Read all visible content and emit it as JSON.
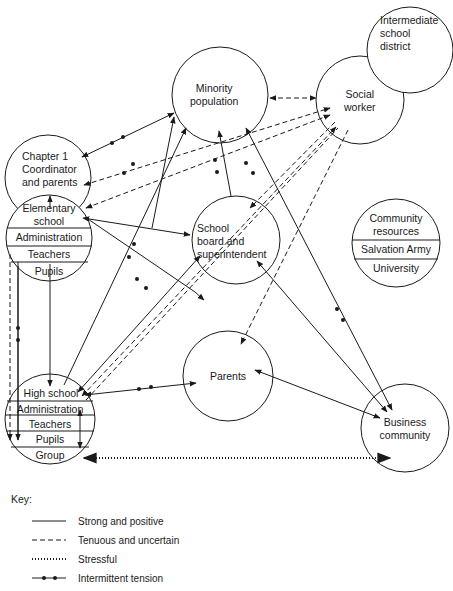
{
  "nodes": {
    "minority_population": [
      "Minority",
      "population"
    ],
    "intermediate_school_district": [
      "Intermediate",
      "school",
      "district"
    ],
    "social_worker": [
      "Social",
      "worker"
    ],
    "chapter1": [
      "Chapter 1",
      "Coordinator",
      "and parents"
    ],
    "elementary_school": {
      "title": [
        "Elementary",
        "school"
      ],
      "sections": [
        "Administration",
        "Teachers",
        "Pupils"
      ]
    },
    "school_board": [
      "School",
      "board and",
      "superintendent"
    ],
    "community_resources": {
      "title": [
        "Community",
        "resources"
      ],
      "sections": [
        "Salvation Army",
        "University"
      ]
    },
    "parents": [
      "Parents"
    ],
    "high_school": {
      "title": "High school",
      "sections": [
        "Administration",
        "Teachers",
        "Pupils",
        "Group"
      ]
    },
    "business_community": [
      "Business",
      "community"
    ]
  },
  "key": {
    "title": "Key:",
    "items": [
      {
        "style": "solid",
        "label": "Strong and positive"
      },
      {
        "style": "dashed",
        "label": "Tenuous and uncertain"
      },
      {
        "style": "dotted",
        "label": "Stressful"
      },
      {
        "style": "dot-dash",
        "label": "Intermittent tension"
      }
    ]
  },
  "edges": [
    {
      "from": "Chapter 1 Coordinator and parents",
      "to": "Minority population",
      "type": "intermittent tension",
      "bidirectional": true
    },
    {
      "from": "Elementary school",
      "to": "Minority population",
      "type": "intermittent tension"
    },
    {
      "from": "Elementary school",
      "to": "Social worker",
      "type": "tenuous and uncertain"
    },
    {
      "from": "Chapter 1 Coordinator and parents",
      "to": "Social worker",
      "type": "tenuous and uncertain"
    },
    {
      "from": "Elementary school",
      "to": "School board and superintendent",
      "type": "strong and positive",
      "bidirectional": true
    },
    {
      "from": "Elementary school",
      "to": "Parents",
      "type": "intermittent tension"
    },
    {
      "from": "Elementary school",
      "to": "Chapter 1 Coordinator and parents",
      "type": "strong and positive"
    },
    {
      "from": "Elementary school",
      "to": "High school",
      "type": "strong and positive"
    },
    {
      "from": "Minority population",
      "to": "Social worker",
      "type": "tenuous and uncertain",
      "bidirectional": true
    },
    {
      "from": "School board and superintendent",
      "to": "Minority population",
      "type": "intermittent tension"
    },
    {
      "from": "Minority population",
      "to": "Business community",
      "type": "intermittent tension",
      "bidirectional": true
    },
    {
      "from": "High school",
      "to": "Minority population",
      "type": "strong and positive"
    },
    {
      "from": "High school",
      "to": "School board and superintendent",
      "type": "strong and positive",
      "bidirectional": true
    },
    {
      "from": "High school",
      "to": "Social worker",
      "type": "tenuous and uncertain"
    },
    {
      "from": "Social worker",
      "to": "School board and superintendent",
      "type": "tenuous and uncertain"
    },
    {
      "from": "Social worker",
      "to": "Parents",
      "type": "tenuous and uncertain"
    },
    {
      "from": "High school",
      "to": "Parents",
      "type": "intermittent tension"
    },
    {
      "from": "Parents",
      "to": "Business community",
      "type": "strong and positive",
      "bidirectional": true
    },
    {
      "from": "School board and superintendent",
      "to": "Business community",
      "type": "strong and positive",
      "bidirectional": true
    },
    {
      "from": "High school Group",
      "to": "Business community",
      "type": "stressful"
    },
    {
      "from": "Elementary school",
      "to": "High school",
      "type": "intermittent tension"
    },
    {
      "from": "Elementary school",
      "to": "High school",
      "type": "tenuous and uncertain"
    }
  ]
}
